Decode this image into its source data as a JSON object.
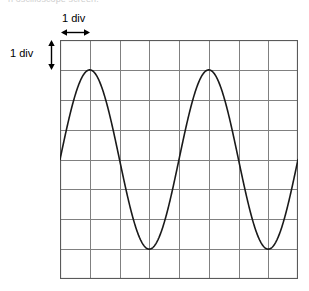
{
  "page": {
    "width": 309,
    "height": 291,
    "background": "#ffffff",
    "title_remnant": "n oscilloscope screen."
  },
  "annotations": {
    "horizontal": {
      "label": "1 div",
      "icon": "double-headed-horizontal-arrow-icon",
      "spans_divisions": 1
    },
    "vertical": {
      "label": "1 div",
      "icon": "double-headed-vertical-arrow-icon",
      "spans_divisions": 1
    }
  },
  "grid": {
    "columns": 8,
    "rows": 8,
    "origin_x": 60,
    "origin_y": 40,
    "cell_width": 29.6,
    "cell_height": 29.8,
    "line_color": "#808080",
    "border_color": "#5a5a5a",
    "line_width": 1
  },
  "chart_data": {
    "type": "line",
    "title": "",
    "subtitle": "",
    "xlabel": "",
    "ylabel": "",
    "grid": true,
    "legend": null,
    "annotations": [
      "1 div",
      "1 div"
    ],
    "units": {
      "x": "divisions",
      "y": "divisions"
    },
    "xlim": [
      0,
      8
    ],
    "ylim": [
      -4,
      4
    ],
    "xticks": [
      0,
      1,
      2,
      3,
      4,
      5,
      6,
      7,
      8
    ],
    "yticks": [
      -4,
      -3,
      -2,
      -1,
      0,
      1,
      2,
      3,
      4
    ],
    "xticklabels": [
      "",
      "",
      "",
      "",
      "",
      "",
      "",
      "",
      ""
    ],
    "yticklabels": [
      "",
      "",
      "",
      "",
      "",
      "",
      "",
      "",
      ""
    ],
    "series": [
      {
        "name": "waveform",
        "waveform": "sine",
        "color": "#1a1a1a",
        "line_width": 1.6,
        "amplitude_divisions": 3,
        "period_divisions": 4,
        "frequency_cycles_on_screen": 2,
        "phase_degrees": 0,
        "offset_divisions": 0,
        "equation": "y = 3 * sin(2*pi*x/4)",
        "peaks_x": [
          1,
          5
        ],
        "troughs_x": [
          3,
          7
        ],
        "zero_crossings_x": [
          0,
          2,
          4,
          6,
          8
        ],
        "x": [
          0,
          0.25,
          0.5,
          0.75,
          1,
          1.25,
          1.5,
          1.75,
          2,
          2.25,
          2.5,
          2.75,
          3,
          3.25,
          3.5,
          3.75,
          4,
          4.25,
          4.5,
          4.75,
          5,
          5.25,
          5.5,
          5.75,
          6,
          6.25,
          6.5,
          6.75,
          7,
          7.25,
          7.5,
          7.75,
          8
        ],
        "y": [
          0,
          1.148,
          2.121,
          2.772,
          3,
          2.772,
          2.121,
          1.148,
          0,
          -1.148,
          -2.121,
          -2.772,
          -3,
          -2.772,
          -2.121,
          -1.148,
          0,
          1.148,
          2.121,
          2.772,
          3,
          2.772,
          2.121,
          1.148,
          0,
          -1.148,
          -2.121,
          -2.772,
          -3,
          -2.772,
          -2.121,
          -1.148,
          0
        ]
      }
    ]
  }
}
